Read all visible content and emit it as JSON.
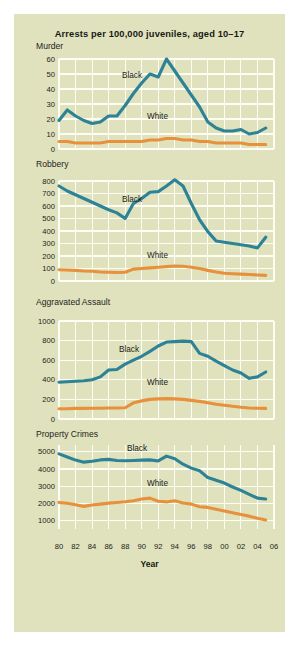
{
  "figure": {
    "title": "Arrests per 100,000 juveniles, aged 10–17",
    "background_color": "#dfe2bd",
    "xaxis_title": "Year",
    "series_colors": {
      "black": "#2e8296",
      "white": "#e8913c"
    },
    "series_labels": {
      "black": "Black",
      "white": "White"
    }
  },
  "chart_data": [
    {
      "type": "line",
      "title": "Murder",
      "xlabel": "Year",
      "ylabel": "",
      "xlim": [
        1980,
        2006
      ],
      "ylim": [
        0,
        60
      ],
      "yticks": [
        0,
        10,
        20,
        30,
        40,
        50,
        60
      ],
      "xticks": [
        "80",
        "82",
        "84",
        "86",
        "88",
        "90",
        "92",
        "94",
        "96",
        "98",
        "00",
        "02",
        "04",
        "06"
      ],
      "grid": true,
      "legend_position": "inline-annotation",
      "x": [
        1980,
        1981,
        1982,
        1983,
        1984,
        1985,
        1986,
        1987,
        1988,
        1989,
        1990,
        1991,
        1992,
        1993,
        1994,
        1995,
        1996,
        1997,
        1998,
        1999,
        2000,
        2001,
        2002,
        2003,
        2004,
        2005
      ],
      "series": [
        {
          "name": "Black",
          "values": [
            19,
            26,
            22,
            19,
            17,
            18,
            22,
            22,
            29,
            37,
            44,
            50,
            48,
            60,
            52,
            44,
            36,
            28,
            18,
            14,
            12,
            12,
            13,
            10,
            11,
            14
          ]
        },
        {
          "name": "White",
          "values": [
            5,
            5,
            4,
            4,
            4,
            4,
            5,
            5,
            5,
            5,
            5,
            6,
            6,
            7,
            7,
            6,
            6,
            5,
            5,
            4,
            4,
            4,
            4,
            3,
            3,
            3
          ]
        }
      ]
    },
    {
      "type": "line",
      "title": "Robbery",
      "xlabel": "Year",
      "ylabel": "",
      "xlim": [
        1980,
        2006
      ],
      "ylim": [
        0,
        800
      ],
      "yticks": [
        0,
        100,
        200,
        300,
        400,
        500,
        600,
        700,
        800
      ],
      "xticks": [
        "80",
        "82",
        "84",
        "86",
        "88",
        "90",
        "92",
        "94",
        "96",
        "98",
        "00",
        "02",
        "04",
        "06"
      ],
      "grid": true,
      "legend_position": "inline-annotation",
      "x": [
        1980,
        1981,
        1982,
        1983,
        1984,
        1985,
        1986,
        1987,
        1988,
        1989,
        1990,
        1991,
        1992,
        1993,
        1994,
        1995,
        1996,
        1997,
        1998,
        1999,
        2000,
        2001,
        2002,
        2003,
        2004,
        2005
      ],
      "series": [
        {
          "name": "Black",
          "values": [
            760,
            720,
            690,
            660,
            630,
            600,
            570,
            545,
            500,
            620,
            660,
            710,
            715,
            760,
            810,
            760,
            620,
            490,
            395,
            320,
            310,
            300,
            290,
            280,
            265,
            350
          ]
        },
        {
          "name": "White",
          "values": [
            90,
            88,
            85,
            80,
            78,
            72,
            70,
            68,
            70,
            95,
            100,
            105,
            110,
            115,
            120,
            118,
            110,
            100,
            85,
            72,
            62,
            58,
            55,
            52,
            48,
            45
          ]
        }
      ]
    },
    {
      "type": "line",
      "title": "Aggravated Assault",
      "xlabel": "Year",
      "ylabel": "",
      "xlim": [
        1980,
        2006
      ],
      "ylim": [
        0,
        1000
      ],
      "yticks": [
        0,
        200,
        400,
        600,
        800,
        1000
      ],
      "xticks": [
        "80",
        "82",
        "84",
        "86",
        "88",
        "90",
        "92",
        "94",
        "96",
        "98",
        "00",
        "02",
        "04",
        "06"
      ],
      "grid": true,
      "legend_position": "inline-annotation",
      "x": [
        1980,
        1981,
        1982,
        1983,
        1984,
        1985,
        1986,
        1987,
        1988,
        1989,
        1990,
        1991,
        1992,
        1993,
        1994,
        1995,
        1996,
        1997,
        1998,
        1999,
        2000,
        2001,
        2002,
        2003,
        2004,
        2005
      ],
      "series": [
        {
          "name": "Black",
          "values": [
            375,
            380,
            385,
            390,
            400,
            430,
            500,
            505,
            560,
            600,
            640,
            690,
            745,
            785,
            790,
            795,
            790,
            670,
            640,
            590,
            545,
            500,
            470,
            415,
            430,
            480
          ]
        },
        {
          "name": "White",
          "values": [
            105,
            105,
            108,
            108,
            110,
            110,
            112,
            112,
            115,
            165,
            185,
            200,
            205,
            208,
            205,
            200,
            190,
            180,
            165,
            150,
            140,
            130,
            120,
            112,
            110,
            108
          ]
        }
      ]
    },
    {
      "type": "line",
      "title": "Property Crimes",
      "xlabel": "Year",
      "ylabel": "",
      "xlim": [
        1980,
        2006
      ],
      "ylim": [
        500,
        5400
      ],
      "yticks": [
        1000,
        2000,
        3000,
        4000,
        5000
      ],
      "xticks": [
        "80",
        "82",
        "84",
        "86",
        "88",
        "90",
        "92",
        "94",
        "96",
        "98",
        "00",
        "02",
        "04",
        "06"
      ],
      "grid": true,
      "legend_position": "inline-annotation",
      "x": [
        1980,
        1981,
        1982,
        1983,
        1984,
        1985,
        1986,
        1987,
        1988,
        1989,
        1990,
        1991,
        1992,
        1993,
        1994,
        1995,
        1996,
        1997,
        1998,
        1999,
        2000,
        2001,
        2002,
        2003,
        2004,
        2005
      ],
      "series": [
        {
          "name": "Black",
          "values": [
            4880,
            4700,
            4520,
            4400,
            4450,
            4530,
            4560,
            4500,
            4480,
            4500,
            4520,
            4530,
            4470,
            4750,
            4600,
            4280,
            4050,
            3900,
            3500,
            3340,
            3180,
            2950,
            2750,
            2520,
            2300,
            2250
          ]
        },
        {
          "name": "White",
          "values": [
            2050,
            2000,
            1910,
            1820,
            1900,
            1950,
            2010,
            2050,
            2090,
            2150,
            2250,
            2300,
            2120,
            2080,
            2150,
            2020,
            1950,
            1800,
            1760,
            1650,
            1550,
            1450,
            1350,
            1250,
            1130,
            1030
          ]
        }
      ]
    }
  ]
}
